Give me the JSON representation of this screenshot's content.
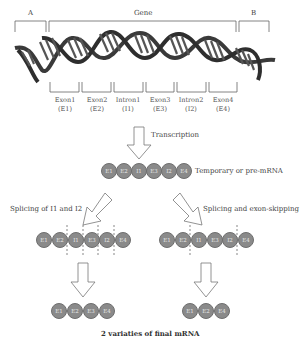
{
  "diagram": {
    "top_labels": {
      "region_a": "A",
      "gene": "Gene",
      "region_b": "B"
    },
    "segments": [
      {
        "name": "Exon1",
        "abbr": "(E1)"
      },
      {
        "name": "Exon2",
        "abbr": "(E2)"
      },
      {
        "name": "Intron1",
        "abbr": "(I1)"
      },
      {
        "name": "Exon3",
        "abbr": "(E3)"
      },
      {
        "name": "Intron2",
        "abbr": "(I2)"
      },
      {
        "name": "Exon4",
        "abbr": "(E4)"
      }
    ],
    "transcription_label": "Transcription",
    "pre_mrna": {
      "label": "Temporary or pre-mRNA",
      "beads": [
        "E1",
        "E2",
        "I1",
        "E3",
        "I2",
        "E4"
      ]
    },
    "left_branch": {
      "label": "Splicing of I1 and I2",
      "beads": [
        "E1",
        "E2",
        "I1",
        "E3",
        "I2",
        "E4"
      ],
      "final_beads": [
        "E1",
        "E2",
        "E3",
        "E4"
      ]
    },
    "right_branch": {
      "label": "Splicing and exon-skipping",
      "beads": [
        "E1",
        "E2",
        "I1",
        "E3",
        "I2",
        "E4"
      ],
      "final_beads": [
        "E1",
        "E2",
        "E4"
      ]
    },
    "footer_label": "2 variaties of final mRNA",
    "colors": {
      "bead_fill": "#8a8a8a",
      "bead_text": "#e8e8e8",
      "helix_dark": "#3a3a3a",
      "bracket": "#666666"
    }
  }
}
